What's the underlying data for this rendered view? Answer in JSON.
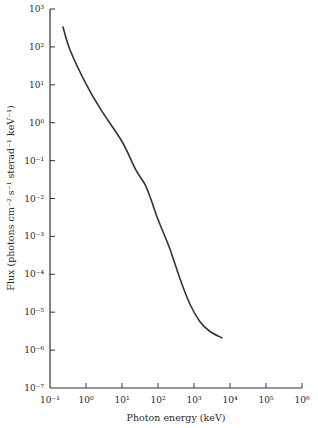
{
  "chart_data": {
    "type": "line",
    "title": "",
    "xlabel": "Photon energy (keV)",
    "ylabel": "Flux (photons cm⁻² s⁻¹ sterad⁻¹ keV⁻¹)",
    "xscale": "log",
    "yscale": "log",
    "xlim": [
      0.1,
      1000000
    ],
    "ylim": [
      1e-07,
      1000
    ],
    "grid": false,
    "legend": null,
    "x_ticks": [
      {
        "exp": -1,
        "label": "10⁻¹"
      },
      {
        "exp": 0,
        "label": "10⁰"
      },
      {
        "exp": 1,
        "label": "10¹"
      },
      {
        "exp": 2,
        "label": "10²"
      },
      {
        "exp": 3,
        "label": "10³"
      },
      {
        "exp": 4,
        "label": "10⁴"
      },
      {
        "exp": 5,
        "label": "10⁵"
      },
      {
        "exp": 6,
        "label": "10⁶"
      }
    ],
    "y_ticks": [
      {
        "exp": 3,
        "label": "10³"
      },
      {
        "exp": 2,
        "label": "10²"
      },
      {
        "exp": 1,
        "label": "10¹"
      },
      {
        "exp": 0,
        "label": "10⁰"
      },
      {
        "exp": -1,
        "label": "10⁻¹"
      },
      {
        "exp": -2,
        "label": "10⁻²"
      },
      {
        "exp": -3,
        "label": "10⁻³"
      },
      {
        "exp": -4,
        "label": "10⁻⁴"
      },
      {
        "exp": -5,
        "label": "10⁻⁵"
      },
      {
        "exp": -6,
        "label": "10⁻⁶"
      },
      {
        "exp": -7,
        "label": "10⁻⁷"
      }
    ],
    "series": [
      {
        "name": "Diffuse X-ray / gamma-ray background spectrum",
        "color": "#333333",
        "x": [
          0.23,
          0.36,
          1.0,
          2.6,
          10,
          24,
          44,
          64,
          100,
          215,
          410,
          780,
          1470,
          2780,
          6000
        ],
        "y": [
          336,
          83,
          10.6,
          2.2,
          0.32,
          0.058,
          0.023,
          0.0094,
          0.0028,
          0.00046,
          7.5e-05,
          1.6e-05,
          5.6e-06,
          3.1e-06,
          2.1e-06
        ]
      }
    ]
  }
}
